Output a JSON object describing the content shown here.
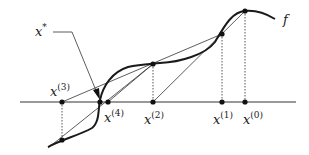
{
  "diagram": {
    "type": "secant-method-iteration",
    "function_label": "f",
    "root_label": "x",
    "root_superscript": "*",
    "iterates": [
      {
        "name": "x",
        "index": "(0)"
      },
      {
        "name": "x",
        "index": "(1)"
      },
      {
        "name": "x",
        "index": "(2)"
      },
      {
        "name": "x",
        "index": "(3)"
      },
      {
        "name": "x",
        "index": "(4)"
      }
    ],
    "colors": {
      "curve": "#1a1a1a",
      "axis": "#333333",
      "secant": "#333333",
      "dotted": "#444444",
      "point": "#111111"
    }
  }
}
